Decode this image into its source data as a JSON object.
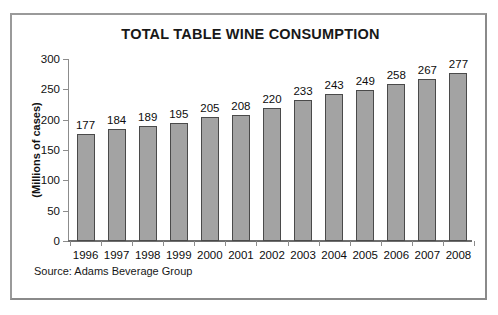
{
  "chart_data": {
    "type": "bar",
    "title": "TOTAL TABLE WINE CONSUMPTION",
    "xlabel": "",
    "ylabel": "(Millions of cases)",
    "categories": [
      "1996",
      "1997",
      "1998",
      "1999",
      "2000",
      "2001",
      "2002",
      "2003",
      "2004",
      "2005",
      "2006",
      "2007",
      "2008"
    ],
    "values": [
      177,
      184,
      189,
      195,
      205,
      208,
      220,
      233,
      243,
      249,
      258,
      267,
      277
    ],
    "ylim": [
      0,
      300
    ],
    "yticks": [
      0,
      50,
      100,
      150,
      200,
      250,
      300
    ],
    "grid": false,
    "legend": null,
    "bar_fill_color": "#a3a3a3",
    "bar_edge_color": "#4a4a4a",
    "annotations": [
      "Source: Adams Beverage Group"
    ]
  },
  "source_note": "Source: Adams Beverage Group",
  "frame": {
    "border_color": "#8d8d8d"
  }
}
